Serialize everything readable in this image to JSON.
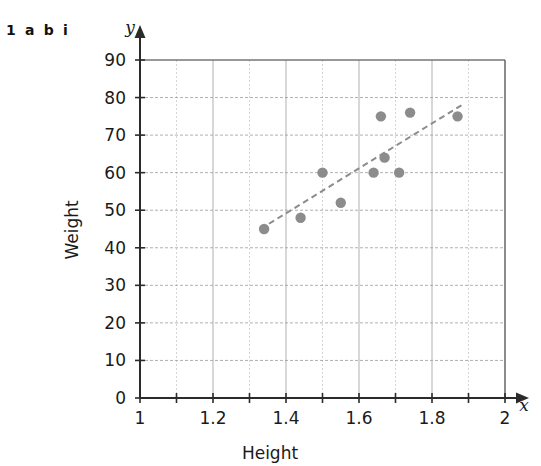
{
  "figure": {
    "question_label": "1 a b i"
  },
  "chart_data": {
    "type": "scatter",
    "title": "",
    "xlabel": "Height",
    "ylabel": "Weight",
    "x_axis_var": "x",
    "y_axis_var": "y",
    "xlim": [
      1,
      2
    ],
    "ylim": [
      0,
      90
    ],
    "x_major_ticks": [
      1,
      1.2,
      1.4,
      1.6,
      1.8,
      2
    ],
    "x_major_tick_labels": [
      "1",
      "1.2",
      "1.4",
      "1.6",
      "1.8",
      "2"
    ],
    "x_minor_ticks": [
      1.1,
      1.3,
      1.5,
      1.7,
      1.9
    ],
    "y_major_ticks": [
      0,
      10,
      20,
      30,
      40,
      50,
      60,
      70,
      80,
      90
    ],
    "y_major_tick_labels": [
      "0",
      "10",
      "20",
      "30",
      "40",
      "50",
      "60",
      "70",
      "80",
      "90"
    ],
    "grid": true,
    "grid_color": "#9a9a9a",
    "point_color": "#8c8c8c",
    "trend_color": "#8c8c8c",
    "axis_color": "#2b2b2b",
    "legend": null,
    "points": [
      {
        "x": 1.34,
        "y": 45
      },
      {
        "x": 1.44,
        "y": 48
      },
      {
        "x": 1.5,
        "y": 60
      },
      {
        "x": 1.55,
        "y": 52
      },
      {
        "x": 1.64,
        "y": 60
      },
      {
        "x": 1.66,
        "y": 75
      },
      {
        "x": 1.67,
        "y": 64
      },
      {
        "x": 1.71,
        "y": 60
      },
      {
        "x": 1.74,
        "y": 76
      },
      {
        "x": 1.87,
        "y": 75
      }
    ],
    "trend_line": {
      "style": "dashed",
      "x_start": 1.33,
      "y_start": 45,
      "x_end": 1.89,
      "y_end": 78.5
    }
  }
}
